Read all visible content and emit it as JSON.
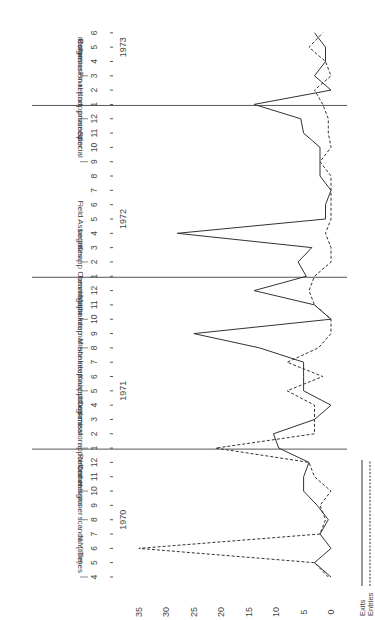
{
  "chart_data": {
    "type": "line",
    "title": "",
    "orientation": "rotated-90-ccw",
    "xlabel": "Month",
    "ylabel": "",
    "ylim": [
      0,
      35
    ],
    "yticks": [
      0,
      5,
      10,
      15,
      20,
      25,
      30,
      35
    ],
    "years": [
      {
        "label": "1970",
        "start_index": 0
      },
      {
        "label": "1971",
        "start_index": 9
      },
      {
        "label": "1972",
        "start_index": 21
      },
      {
        "label": "1973",
        "start_index": 33
      }
    ],
    "categories": [
      "4",
      "5",
      "6",
      "7",
      "8",
      "9",
      "10",
      "11",
      "12",
      "1",
      "2",
      "3",
      "4",
      "5",
      "6",
      "7",
      "8",
      "9",
      "10",
      "11",
      "12",
      "1",
      "2",
      "3",
      "4",
      "5",
      "6",
      "7",
      "8",
      "9",
      "10",
      "11",
      "12",
      "1",
      "2",
      "3",
      "4",
      "5",
      "6"
    ],
    "year_dividers": [
      9,
      21,
      33
    ],
    "series": [
      {
        "name": "Exits",
        "style": "solid",
        "values": [
          0,
          3,
          0,
          2,
          0.5,
          2.5,
          5,
          5,
          4,
          9.5,
          10.5,
          3,
          0,
          5,
          5,
          5,
          13,
          25,
          0,
          3,
          14,
          4.5,
          6,
          3.5,
          28,
          1,
          1,
          0,
          2,
          2,
          2,
          5,
          5.5,
          14,
          0,
          3,
          1,
          1,
          3
        ]
      },
      {
        "name": "Entries",
        "style": "dashed",
        "values": [
          0.5,
          3,
          35,
          2,
          1,
          2,
          0,
          3,
          4,
          21,
          3,
          3,
          3,
          8,
          1.5,
          8,
          2.3,
          0,
          0,
          3,
          4,
          3,
          0,
          0,
          1,
          0,
          0,
          0,
          0,
          2,
          0,
          0.5,
          0.5,
          1.5,
          3,
          0,
          1,
          4,
          1.5
        ]
      }
    ],
    "annotations": [
      {
        "index": 0,
        "lines": [
          "N.Y. Times",
          "scandal (title)"
        ]
      },
      {
        "index": 4,
        "lines": [
          "Commissioner",
          "resigns"
        ]
      },
      {
        "index": 6,
        "lines": [
          "Reformer",
          "appointed"
        ]
      },
      {
        "index": 9,
        "lines": [
          "Knapp Commission",
          "catches meat",
          "burglars"
        ]
      },
      {
        "index": 13,
        "lines": [
          "Minor internal",
          "shakeup"
        ]
      },
      {
        "index": 16,
        "lines": [
          "Major internal",
          "shakeup"
        ]
      },
      {
        "index": 18,
        "lines": [
          "Knapp Commission",
          "hearings"
        ]
      },
      {
        "index": 22,
        "lines": [
          "Field Associates",
          "begin"
        ]
      },
      {
        "index": 29,
        "lines": [
          "Special",
          "prosecutor",
          "named"
        ]
      },
      {
        "index": 32,
        "lines": [
          "Final Knapp",
          "Commission report"
        ]
      },
      {
        "index": 35,
        "lines": [
          "Reformer",
          "resigns"
        ]
      }
    ],
    "legend": [
      {
        "label": "Exits",
        "style": "solid"
      },
      {
        "label": "Entries",
        "style": "dashed"
      }
    ],
    "grid": false,
    "legend_position": "bottom-right"
  },
  "colors": {
    "line": "#333333",
    "axis": "#555555",
    "text": "#444444"
  }
}
